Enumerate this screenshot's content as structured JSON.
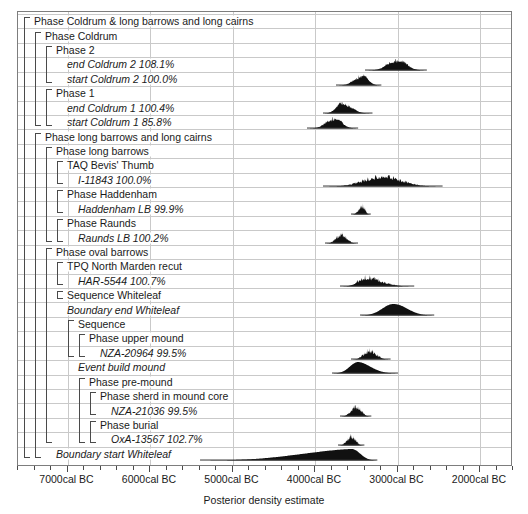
{
  "chart_data": {
    "type": "area",
    "title": "",
    "xlabel": "Posterior density estimate",
    "ylabel": "",
    "xlim": [
      -7600,
      -1600
    ],
    "grid": true,
    "legend": false,
    "axis_ticks": [
      {
        "label": "7000cal BC",
        "value": -7000
      },
      {
        "label": "6000cal BC",
        "value": -6000
      },
      {
        "label": "5000cal BC",
        "value": -5000
      },
      {
        "label": "4000cal BC",
        "value": -4000
      },
      {
        "label": "3000cal BC",
        "value": -3000
      },
      {
        "label": "2000cal BC",
        "value": -2000
      }
    ],
    "minor_tick_step": 200,
    "rows": [
      {
        "label": "Phase Coldrum & long barrows and long cairns",
        "kind": "group",
        "indent": 0,
        "agreement": ""
      },
      {
        "label": "Phase Coldrum",
        "kind": "group",
        "indent": 1,
        "agreement": ""
      },
      {
        "label": "Phase 2",
        "kind": "group",
        "indent": 2,
        "agreement": ""
      },
      {
        "label": "end Coldrum 2  108.1%",
        "kind": "dist",
        "indent": 3,
        "agreement": "108.1%",
        "range": [
          -3400,
          -2650
        ],
        "peak": -3000
      },
      {
        "label": "start Coldrum 2  100.0%",
        "kind": "dist",
        "indent": 3,
        "agreement": "100.0%",
        "range": [
          -3750,
          -3200
        ],
        "peak": -3420
      },
      {
        "label": "Phase 1",
        "kind": "group",
        "indent": 2,
        "agreement": ""
      },
      {
        "label": "end Coldrum 1  100.4%",
        "kind": "dist",
        "indent": 3,
        "agreement": "100.4%",
        "range": [
          -3900,
          -3300
        ],
        "peak": -3680
      },
      {
        "label": "start Coldrum 1  85.8%",
        "kind": "dist",
        "indent": 3,
        "agreement": "85.8%",
        "range": [
          -4100,
          -3480
        ],
        "peak": -3760
      },
      {
        "label": "Phase long barrows and long cairns",
        "kind": "group",
        "indent": 1,
        "agreement": ""
      },
      {
        "label": "Phase long barrows",
        "kind": "group",
        "indent": 2,
        "agreement": ""
      },
      {
        "label": "TAQ Bevis' Thumb",
        "kind": "group",
        "indent": 3,
        "agreement": ""
      },
      {
        "label": "I-11843  100.0%",
        "kind": "dist",
        "indent": 4,
        "agreement": "100.0%",
        "range": [
          -3900,
          -2450
        ],
        "peak": -3180
      },
      {
        "label": "Phase Haddenham",
        "kind": "group",
        "indent": 3,
        "agreement": ""
      },
      {
        "label": "Haddenham LB  99.9%",
        "kind": "dist",
        "indent": 4,
        "agreement": "99.9%",
        "range": [
          -3560,
          -3320
        ],
        "peak": -3420
      },
      {
        "label": "Phase Raunds",
        "kind": "group",
        "indent": 3,
        "agreement": ""
      },
      {
        "label": "Raunds LB  100.2%",
        "kind": "dist",
        "indent": 4,
        "agreement": "100.2%",
        "range": [
          -3880,
          -3480
        ],
        "peak": -3680
      },
      {
        "label": "Phase oval barrows",
        "kind": "group",
        "indent": 2,
        "agreement": ""
      },
      {
        "label": "TPQ North Marden recut",
        "kind": "group",
        "indent": 3,
        "agreement": ""
      },
      {
        "label": "HAR-5544  100.7%",
        "kind": "dist",
        "indent": 4,
        "agreement": "100.7%",
        "range": [
          -3700,
          -2800
        ],
        "peak": -3380
      },
      {
        "label": "Sequence Whiteleaf",
        "kind": "group",
        "indent": 3,
        "agreement": ""
      },
      {
        "label": "Boundary end Whiteleaf",
        "kind": "dist",
        "indent": 3,
        "agreement": "",
        "range": [
          -3450,
          -2550
        ],
        "peak": -3050
      },
      {
        "label": "Sequence",
        "kind": "group",
        "indent": 4,
        "agreement": ""
      },
      {
        "label": "Phase upper mound",
        "kind": "group",
        "indent": 5,
        "agreement": ""
      },
      {
        "label": "NZA-20964  99.5%",
        "kind": "dist",
        "indent": 6,
        "agreement": "99.5%",
        "range": [
          -3560,
          -3080
        ],
        "peak": -3340
      },
      {
        "label": "Event build mound",
        "kind": "dist",
        "indent": 4,
        "agreement": "",
        "range": [
          -3800,
          -3000
        ],
        "peak": -3480
      },
      {
        "label": "Phase pre-mound",
        "kind": "group",
        "indent": 5,
        "agreement": ""
      },
      {
        "label": "Phase sherd in mound core",
        "kind": "group",
        "indent": 6,
        "agreement": ""
      },
      {
        "label": "NZA-21036  99.5%",
        "kind": "dist",
        "indent": 7,
        "agreement": "99.5%",
        "range": [
          -3700,
          -3320
        ],
        "peak": -3500
      },
      {
        "label": "Phase burial",
        "kind": "group",
        "indent": 6,
        "agreement": ""
      },
      {
        "label": "OxA-13567  102.7%",
        "kind": "dist",
        "indent": 7,
        "agreement": "102.7%",
        "range": [
          -3720,
          -3400
        ],
        "peak": -3560
      },
      {
        "label": "Boundary start Whiteleaf",
        "kind": "dist",
        "indent": 2,
        "agreement": "",
        "range": [
          -5400,
          -3250
        ],
        "peak": -3560
      }
    ]
  },
  "axis": {
    "title": "Posterior density estimate",
    "tick_labels": [
      "7000cal BC",
      "6000cal BC",
      "5000cal BC",
      "4000cal BC",
      "3000cal BC",
      "2000cal BC"
    ]
  },
  "rows": [
    {
      "text": "Phase Coldrum & long barrows and long cairns"
    },
    {
      "text": "Phase Coldrum"
    },
    {
      "text": "Phase 2"
    },
    {
      "text": "end Coldrum 2  108.1%"
    },
    {
      "text": "start Coldrum 2  100.0%"
    },
    {
      "text": "Phase 1"
    },
    {
      "text": "end Coldrum 1  100.4%"
    },
    {
      "text": "start Coldrum 1  85.8%"
    },
    {
      "text": "Phase long barrows and long cairns"
    },
    {
      "text": "Phase long barrows"
    },
    {
      "text": "TAQ Bevis' Thumb"
    },
    {
      "text": "I-11843  100.0%"
    },
    {
      "text": "Phase Haddenham"
    },
    {
      "text": "Haddenham LB  99.9%"
    },
    {
      "text": "Phase Raunds"
    },
    {
      "text": "Raunds LB  100.2%"
    },
    {
      "text": "Phase oval barrows"
    },
    {
      "text": "TPQ North Marden recut"
    },
    {
      "text": "HAR-5544  100.7%"
    },
    {
      "text": "Sequence Whiteleaf"
    },
    {
      "text": "Boundary end Whiteleaf"
    },
    {
      "text": "Sequence"
    },
    {
      "text": "Phase upper mound"
    },
    {
      "text": "NZA-20964  99.5%"
    },
    {
      "text": "Event build mound"
    },
    {
      "text": "Phase pre-mound"
    },
    {
      "text": "Phase sherd in mound core"
    },
    {
      "text": "NZA-21036  99.5%"
    },
    {
      "text": "Phase burial"
    },
    {
      "text": "OxA-13567  102.7%"
    },
    {
      "text": "Boundary start Whiteleaf"
    }
  ],
  "colors": {
    "distribution_fill": "#111111",
    "frame": "#7d7d7d",
    "grid": "#c9c9c9",
    "bracket": "#4a4a4a",
    "text": "#1a1a1a",
    "background": "#ffffff"
  }
}
